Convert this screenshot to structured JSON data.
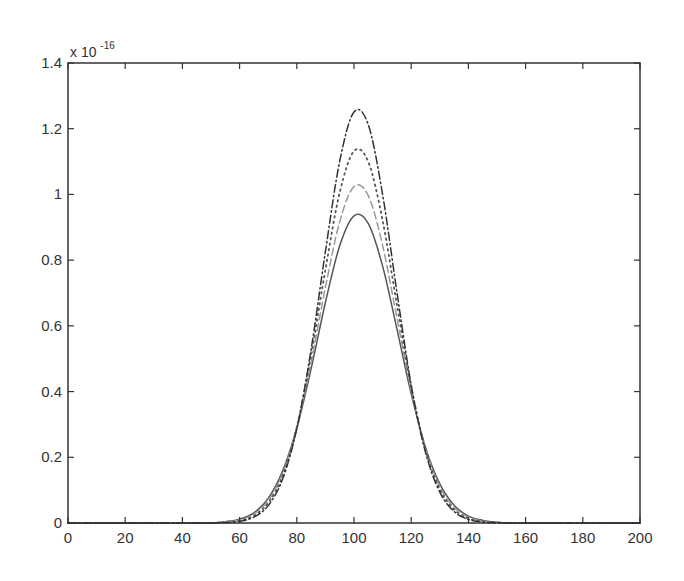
{
  "figure": {
    "background": "#ffffff",
    "axes_color": "#333333",
    "exponent_label": {
      "base": "x 10",
      "power": "-16"
    }
  },
  "chart_data": {
    "type": "line",
    "title": "",
    "xlabel": "",
    "ylabel": "",
    "xlim": [
      0,
      200
    ],
    "ylim": [
      0,
      1.4
    ],
    "y_scale_factor": "x 10^-16",
    "grid": false,
    "legend": null,
    "xticks": [
      0,
      20,
      40,
      60,
      80,
      100,
      120,
      140,
      160,
      180,
      200
    ],
    "xtick_labels": [
      "0",
      "20",
      "40",
      "60",
      "80",
      "100",
      "120",
      "140",
      "160",
      "180",
      "200"
    ],
    "yticks": [
      0,
      0.2,
      0.4,
      0.6,
      0.8,
      1.0,
      1.2,
      1.4
    ],
    "ytick_labels": [
      "0",
      "0.2",
      "0.4",
      "0.6",
      "0.8",
      "1",
      "1.2",
      "1.4"
    ],
    "x": [
      0,
      5,
      10,
      15,
      20,
      25,
      30,
      35,
      40,
      45,
      50,
      55,
      60,
      65,
      70,
      75,
      80,
      85,
      90,
      95,
      100,
      105,
      110,
      115,
      120,
      125,
      130,
      135,
      140,
      145,
      150,
      155,
      160,
      165,
      170,
      175,
      180,
      185,
      190,
      195,
      200
    ],
    "series": [
      {
        "name": "solid",
        "style": "solid",
        "color": "#555555",
        "peak": 0.94,
        "values": [
          0,
          0,
          0,
          0,
          0,
          0,
          0,
          0,
          0,
          0,
          0,
          0.004,
          0.012,
          0.031,
          0.075,
          0.157,
          0.289,
          0.469,
          0.671,
          0.844,
          0.935,
          0.911,
          0.782,
          0.591,
          0.393,
          0.23,
          0.119,
          0.054,
          0.021,
          0.008,
          0.002,
          0,
          0,
          0,
          0,
          0,
          0,
          0,
          0,
          0,
          0
        ]
      },
      {
        "name": "dashed",
        "style": "dashed",
        "color": "#9a9a9a",
        "peak": 1.03,
        "values": [
          0,
          0,
          0,
          0,
          0,
          0,
          0,
          0,
          0,
          0,
          0,
          0.003,
          0.009,
          0.027,
          0.068,
          0.15,
          0.289,
          0.488,
          0.717,
          0.917,
          1.024,
          0.996,
          0.845,
          0.625,
          0.403,
          0.227,
          0.111,
          0.047,
          0.018,
          0.006,
          0.002,
          0,
          0,
          0,
          0,
          0,
          0,
          0,
          0,
          0,
          0
        ]
      },
      {
        "name": "dotted",
        "style": "dotted",
        "color": "#555555",
        "peak": 1.14,
        "values": [
          0,
          0,
          0,
          0,
          0,
          0,
          0,
          0,
          0,
          0,
          0,
          0.002,
          0.007,
          0.022,
          0.061,
          0.142,
          0.29,
          0.51,
          0.771,
          1.006,
          1.132,
          1.099,
          0.921,
          0.665,
          0.414,
          0.223,
          0.103,
          0.041,
          0.014,
          0.004,
          0.001,
          0,
          0,
          0,
          0,
          0,
          0,
          0,
          0,
          0,
          0
        ]
      },
      {
        "name": "dash-dot",
        "style": "dashdot",
        "color": "#333333",
        "peak": 1.26,
        "values": [
          0,
          0,
          0,
          0,
          0,
          0,
          0,
          0,
          0,
          0,
          0,
          0.001,
          0.005,
          0.018,
          0.053,
          0.133,
          0.287,
          0.528,
          0.826,
          1.101,
          1.251,
          1.212,
          1.0,
          0.703,
          0.42,
          0.215,
          0.094,
          0.035,
          0.011,
          0.003,
          0.001,
          0,
          0,
          0,
          0,
          0,
          0,
          0,
          0,
          0,
          0
        ]
      }
    ]
  }
}
